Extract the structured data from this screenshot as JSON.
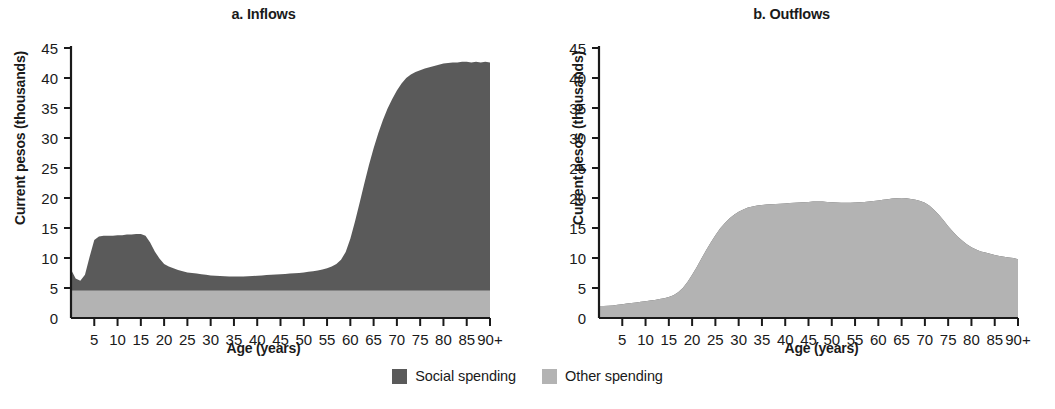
{
  "figure": {
    "y_axis_title": "Current pesos (thousands)",
    "x_axis_title": "Age (years)",
    "panels": [
      {
        "id": "a",
        "title": "a. Inflows"
      },
      {
        "id": "b",
        "title": "b. Outflows"
      }
    ]
  },
  "legend": {
    "position": "bottom-center",
    "items": [
      {
        "label": "Social spending",
        "color": "#5a5a5a"
      },
      {
        "label": "Other spending",
        "color": "#b3b3b3"
      }
    ]
  },
  "colors": {
    "social_spending": "#5a5a5a",
    "other_spending": "#b3b3b3",
    "axis": "#1a1a1a",
    "background": "#ffffff"
  },
  "axis": {
    "y_ticks": [
      0,
      5,
      10,
      15,
      20,
      25,
      30,
      35,
      40,
      45
    ],
    "y_tick_labels": [
      "0",
      "5",
      "10",
      "15",
      "20",
      "25",
      "30",
      "35",
      "40",
      "45"
    ],
    "ylim": [
      0,
      45
    ],
    "x_ticks": [
      5,
      10,
      15,
      20,
      25,
      30,
      35,
      40,
      45,
      50,
      55,
      60,
      65,
      70,
      75,
      80,
      85,
      90
    ],
    "x_tick_labels": [
      "5",
      "10",
      "15",
      "20",
      "25",
      "30",
      "35",
      "40",
      "45",
      "50",
      "55",
      "60",
      "65",
      "70",
      "75",
      "80",
      "85",
      "90+"
    ],
    "xlim": [
      0,
      90
    ]
  },
  "chart_data": [
    {
      "type": "area",
      "title": "a. Inflows",
      "xlabel": "Age (years)",
      "ylabel": "Current pesos (thousands)",
      "xlim": [
        0,
        90
      ],
      "ylim": [
        0,
        45
      ],
      "grid": false,
      "stacked": true,
      "legend_position": "bottom-center",
      "x": [
        0,
        1,
        2,
        3,
        4,
        5,
        6,
        7,
        8,
        9,
        10,
        11,
        12,
        13,
        14,
        15,
        16,
        17,
        18,
        19,
        20,
        21,
        22,
        23,
        24,
        25,
        26,
        27,
        28,
        29,
        30,
        31,
        32,
        33,
        34,
        35,
        36,
        37,
        38,
        39,
        40,
        41,
        42,
        43,
        44,
        45,
        46,
        47,
        48,
        49,
        50,
        51,
        52,
        53,
        54,
        55,
        56,
        57,
        58,
        59,
        60,
        61,
        62,
        63,
        64,
        65,
        66,
        67,
        68,
        69,
        70,
        71,
        72,
        73,
        74,
        75,
        76,
        77,
        78,
        79,
        80,
        81,
        82,
        83,
        84,
        85,
        86,
        87,
        88,
        89,
        90
      ],
      "series": [
        {
          "name": "Other spending",
          "color": "#b3b3b3",
          "values": [
            4.6,
            4.6,
            4.6,
            4.6,
            4.6,
            4.6,
            4.6,
            4.6,
            4.6,
            4.6,
            4.6,
            4.6,
            4.6,
            4.6,
            4.6,
            4.6,
            4.6,
            4.6,
            4.6,
            4.6,
            4.6,
            4.6,
            4.6,
            4.6,
            4.6,
            4.6,
            4.6,
            4.6,
            4.6,
            4.6,
            4.6,
            4.6,
            4.6,
            4.6,
            4.6,
            4.6,
            4.6,
            4.6,
            4.6,
            4.6,
            4.6,
            4.6,
            4.6,
            4.6,
            4.6,
            4.6,
            4.6,
            4.6,
            4.6,
            4.6,
            4.6,
            4.6,
            4.6,
            4.6,
            4.6,
            4.6,
            4.6,
            4.6,
            4.6,
            4.6,
            4.6,
            4.6,
            4.6,
            4.6,
            4.6,
            4.6,
            4.6,
            4.6,
            4.6,
            4.6,
            4.6,
            4.6,
            4.6,
            4.6,
            4.6,
            4.6,
            4.6,
            4.6,
            4.6,
            4.6,
            4.6,
            4.6,
            4.6,
            4.6,
            4.6,
            4.6,
            4.6,
            4.6,
            4.6,
            4.6,
            4.6
          ]
        },
        {
          "name": "Social spending",
          "color": "#5a5a5a",
          "values": [
            3.5,
            2.0,
            1.6,
            2.6,
            5.6,
            8.4,
            9.0,
            9.1,
            9.1,
            9.1,
            9.2,
            9.2,
            9.3,
            9.3,
            9.4,
            9.4,
            9.1,
            8.0,
            6.5,
            5.3,
            4.4,
            4.0,
            3.7,
            3.4,
            3.2,
            3.0,
            2.9,
            2.8,
            2.7,
            2.6,
            2.5,
            2.45,
            2.4,
            2.35,
            2.3,
            2.3,
            2.3,
            2.3,
            2.35,
            2.4,
            2.45,
            2.5,
            2.55,
            2.6,
            2.65,
            2.7,
            2.75,
            2.8,
            2.85,
            2.9,
            3.0,
            3.1,
            3.2,
            3.3,
            3.5,
            3.7,
            4.0,
            4.4,
            5.1,
            6.4,
            8.6,
            11.5,
            14.6,
            17.8,
            20.9,
            23.7,
            26.2,
            28.4,
            30.3,
            31.9,
            33.3,
            34.5,
            35.4,
            36.0,
            36.4,
            36.7,
            37.0,
            37.2,
            37.4,
            37.6,
            37.8,
            37.9,
            38.0,
            38.0,
            38.1,
            38.1,
            38.0,
            38.1,
            38.0,
            38.1,
            38.0
          ]
        }
      ],
      "notes": "Inflows peak near 14 thousand pesos at ages 5-16, trough near 7 at ages 30-40, and rise steeply after age 58 to a plateau near 42-43 thousand pesos from age 75 to 90+."
    },
    {
      "type": "area",
      "title": "b. Outflows",
      "xlabel": "Age (years)",
      "ylabel": "Current pesos (thousands)",
      "xlim": [
        0,
        90
      ],
      "ylim": [
        0,
        45
      ],
      "grid": false,
      "stacked": true,
      "legend_position": "bottom-center",
      "x": [
        0,
        1,
        2,
        3,
        4,
        5,
        6,
        7,
        8,
        9,
        10,
        11,
        12,
        13,
        14,
        15,
        16,
        17,
        18,
        19,
        20,
        21,
        22,
        23,
        24,
        25,
        26,
        27,
        28,
        29,
        30,
        31,
        32,
        33,
        34,
        35,
        36,
        37,
        38,
        39,
        40,
        41,
        42,
        43,
        44,
        45,
        46,
        47,
        48,
        49,
        50,
        51,
        52,
        53,
        54,
        55,
        56,
        57,
        58,
        59,
        60,
        61,
        62,
        63,
        64,
        65,
        66,
        67,
        68,
        69,
        70,
        71,
        72,
        73,
        74,
        75,
        76,
        77,
        78,
        79,
        80,
        81,
        82,
        83,
        84,
        85,
        86,
        87,
        88,
        89,
        90
      ],
      "series": [
        {
          "name": "Other spending",
          "color": "#b3b3b3",
          "values": [
            2.0,
            2.0,
            2.05,
            2.1,
            2.2,
            2.3,
            2.4,
            2.5,
            2.6,
            2.7,
            2.8,
            2.9,
            3.0,
            3.15,
            3.3,
            3.5,
            3.8,
            4.3,
            5.0,
            6.0,
            7.2,
            8.5,
            9.9,
            11.3,
            12.6,
            13.8,
            14.9,
            15.8,
            16.6,
            17.2,
            17.7,
            18.1,
            18.4,
            18.6,
            18.75,
            18.85,
            18.9,
            18.95,
            19.0,
            19.05,
            19.1,
            19.15,
            19.2,
            19.25,
            19.3,
            19.35,
            19.4,
            19.4,
            19.4,
            19.35,
            19.3,
            19.25,
            19.2,
            19.2,
            19.2,
            19.25,
            19.3,
            19.35,
            19.4,
            19.5,
            19.6,
            19.7,
            19.8,
            19.9,
            19.95,
            20.0,
            19.95,
            19.85,
            19.7,
            19.5,
            19.2,
            18.7,
            18.0,
            17.2,
            16.3,
            15.3,
            14.4,
            13.6,
            12.9,
            12.3,
            11.8,
            11.4,
            11.1,
            10.9,
            10.7,
            10.5,
            10.35,
            10.2,
            10.1,
            10.0,
            9.8
          ]
        },
        {
          "name": "Social spending",
          "color": "#5a5a5a",
          "values": [
            0,
            0,
            0,
            0,
            0,
            0,
            0,
            0,
            0,
            0,
            0,
            0,
            0,
            0,
            0,
            0,
            0,
            0,
            0,
            0,
            0,
            0,
            0,
            0,
            0,
            0,
            0,
            0,
            0,
            0,
            0,
            0,
            0,
            0,
            0,
            0,
            0,
            0,
            0,
            0,
            0,
            0,
            0,
            0,
            0,
            0,
            0,
            0,
            0,
            0,
            0,
            0,
            0,
            0,
            0,
            0,
            0,
            0,
            0,
            0,
            0,
            0,
            0,
            0,
            0,
            0,
            0,
            0,
            0,
            0,
            0,
            0,
            0,
            0,
            0,
            0,
            0,
            0,
            0,
            0,
            0,
            0,
            0,
            0,
            0,
            0,
            0,
            0,
            0,
            0,
            0
          ]
        }
      ],
      "notes": "Outflows consist entirely of other spending; they start near 2 thousand pesos at age 0, rise steeply between ages 18 and 30, plateau near 19-20 thousand pesos from ages 35 to 70, then decline to about 10 thousand pesos at age 90+."
    }
  ]
}
